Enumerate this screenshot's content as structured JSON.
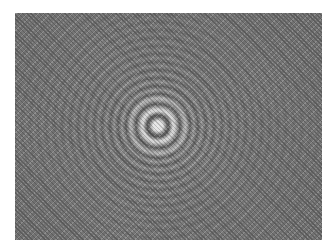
{
  "image": {
    "subject": "concentric interference rings (Newton's rings pattern)",
    "palette": {
      "background": "#ffffff",
      "field": "#6e6e6e",
      "center": "#e8e8e8",
      "dark_ring": "#5a5a5a"
    }
  }
}
